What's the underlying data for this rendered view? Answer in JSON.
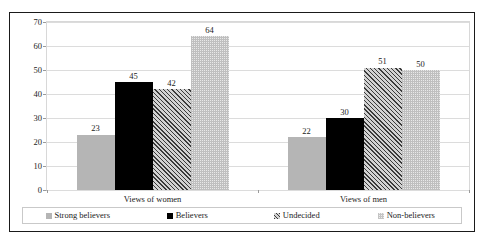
{
  "chart_data": {
    "type": "bar",
    "title": "",
    "subtitle": "",
    "xlabel": "",
    "ylabel": "",
    "categories": [
      "Views of women",
      "Views of men"
    ],
    "series": [
      {
        "name": "Strong believers",
        "values": [
          23,
          22
        ],
        "pattern": "solid-gray",
        "color": "#b5b5b5"
      },
      {
        "name": "Believers",
        "values": [
          45,
          30
        ],
        "pattern": "solid-black",
        "color": "#000000"
      },
      {
        "name": "Undecided",
        "values": [
          42,
          51
        ],
        "pattern": "diagonal-hatch",
        "color": "#3a3a3a"
      },
      {
        "name": "Non-believers",
        "values": [
          64,
          50
        ],
        "pattern": "light-dotted",
        "color": "#e8e8e8"
      }
    ],
    "ylim": [
      0,
      70
    ],
    "yticks": [
      0,
      10,
      20,
      30,
      40,
      50,
      60,
      70
    ],
    "ytick_labels": [
      "0",
      "10",
      "20",
      "30",
      "40",
      "50",
      "60",
      "70"
    ],
    "grid": true,
    "grid_axis": "y",
    "legend_position": "bottom",
    "data_labels": true,
    "border": "#1a1a1a"
  },
  "legend": {
    "items": [
      {
        "label": "Strong believers",
        "swatch": "legend-swatch-strong-believers"
      },
      {
        "label": "Believers",
        "swatch": "legend-swatch-believers"
      },
      {
        "label": "Undecided",
        "swatch": "legend-swatch-undecided"
      },
      {
        "label": "Non-believers",
        "swatch": "legend-swatch-non-believers"
      }
    ]
  }
}
